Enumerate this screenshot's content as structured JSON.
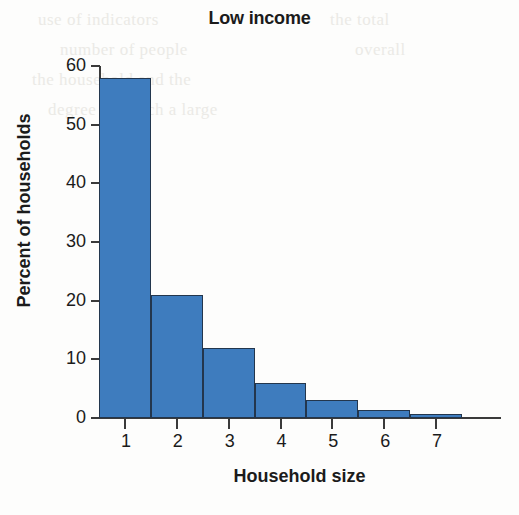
{
  "chart_data": {
    "type": "bar",
    "title": "Low income",
    "xlabel": "Household size",
    "ylabel": "Percent of households",
    "categories": [
      "1",
      "2",
      "3",
      "4",
      "5",
      "6",
      "7"
    ],
    "values": [
      58,
      21,
      12,
      6,
      3,
      1.3,
      0.6
    ],
    "ylim": [
      0,
      60
    ],
    "yticks": [
      0,
      10,
      20,
      30,
      40,
      50,
      60
    ],
    "ytick_labels": [
      "0",
      "10",
      "20",
      "30",
      "40",
      "50",
      "60"
    ],
    "xtick_labels": [
      "1",
      "2",
      "3",
      "4",
      "5",
      "6",
      "7"
    ],
    "grid": false,
    "legend": null,
    "bar_color": "#3e7cbe",
    "bar_edge_color": "#23364d",
    "axis_color": "#3a3a3a",
    "text_color": "#1b1b1b",
    "background": "#fdfdfc"
  },
  "bleedthrough": {
    "line1": "use of indicators",
    "line2": "number of people",
    "line3": "the household and the",
    "line4": "degree to which a large",
    "line5": "the total",
    "line6": "overall"
  }
}
